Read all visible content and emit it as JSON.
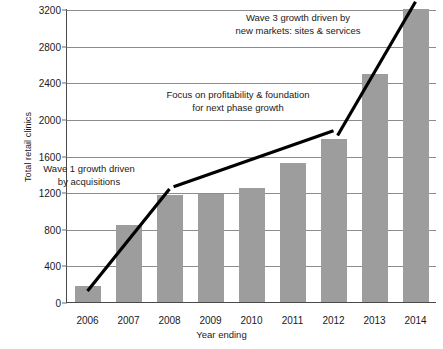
{
  "chart_data": {
    "type": "bar",
    "title": "",
    "xlabel": "Year ending",
    "ylabel": "Total retail clinics",
    "categories": [
      "2006",
      "2007",
      "2008",
      "2009",
      "2010",
      "2011",
      "2012",
      "2013",
      "2014"
    ],
    "values": [
      180,
      845,
      1165,
      1185,
      1250,
      1520,
      1780,
      2490,
      3200
    ],
    "ylim": [
      0,
      3200
    ],
    "yticks": [
      0,
      400,
      800,
      1200,
      1600,
      2000,
      2400,
      2800,
      3200
    ],
    "ytick_labels": [
      "0",
      "400",
      "800",
      "1200",
      "1600",
      "2000",
      "2400",
      "2800",
      "3200"
    ],
    "grid": true,
    "legend": "none",
    "bar_color": "#9d9d9d",
    "gridline_color": "#8c8c8c",
    "axis_color": "#4a4a4a",
    "trend_color": "#000000",
    "annotations": [
      {
        "id": "wave1",
        "text": "Wave 1 growth driven\nby acquisitions"
      },
      {
        "id": "focus",
        "text": "Focus on profitability & foundation\nfor next phase growth"
      },
      {
        "id": "wave3",
        "text": "Wave 3 growth driven by\nnew markets: sites & services"
      }
    ],
    "trend_segments": [
      {
        "name": "wave-1-trend",
        "x1": 2006,
        "y1": 130,
        "x2": 2008,
        "y2": 1245
      },
      {
        "name": "plateau-trend",
        "x1": 2008.1,
        "y1": 1270,
        "x2": 2012,
        "y2": 1880
      },
      {
        "name": "wave-3-trend",
        "x1": 2012.1,
        "y1": 1830,
        "x2": 2014,
        "y2": 3290
      }
    ]
  }
}
